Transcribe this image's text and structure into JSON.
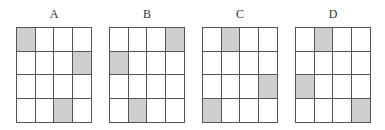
{
  "figure": {
    "rows": 4,
    "cols": 4,
    "shade_color": "#cfcfcf",
    "line_color": "#555555",
    "panels": [
      {
        "label": "A",
        "left": 16,
        "shaded": [
          [
            0,
            0
          ],
          [
            1,
            3
          ],
          [
            3,
            2
          ]
        ]
      },
      {
        "label": "B",
        "left": 109,
        "shaded": [
          [
            0,
            3
          ],
          [
            1,
            0
          ],
          [
            3,
            1
          ]
        ]
      },
      {
        "label": "C",
        "left": 202,
        "shaded": [
          [
            0,
            1
          ],
          [
            2,
            3
          ],
          [
            3,
            0
          ]
        ]
      },
      {
        "label": "D",
        "left": 295,
        "shaded": [
          [
            0,
            1
          ],
          [
            2,
            0
          ],
          [
            3,
            3
          ]
        ]
      }
    ]
  }
}
